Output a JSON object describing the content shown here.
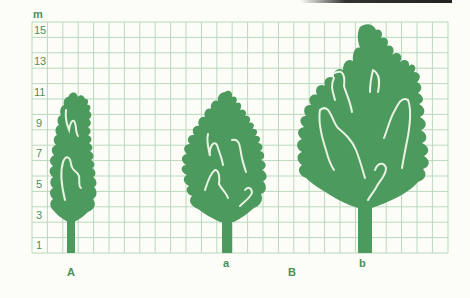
{
  "figure": {
    "unit_label": "m",
    "y_axis_labels": [
      "15",
      "13",
      "11",
      "9",
      "7",
      "5",
      "3",
      "1"
    ],
    "grid": {
      "rows": 15,
      "columns": 27,
      "line_color": "#b9d9bd"
    },
    "tree_color": "#4d9a5e",
    "trees": [
      {
        "id": "A-tree",
        "label": "A",
        "approx_height_m": 10.5
      },
      {
        "id": "a-tree",
        "label": "a",
        "approx_height_m": 10.5
      },
      {
        "id": "b-tree",
        "label": "b",
        "approx_height_m": 15
      }
    ],
    "group_labels": {
      "left": "A",
      "right": "B"
    },
    "sub_labels": {
      "a": "a",
      "b": "b"
    }
  }
}
